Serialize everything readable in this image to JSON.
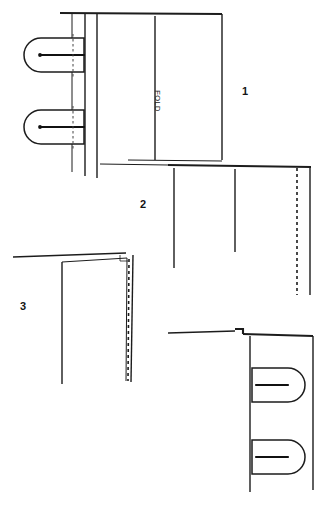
{
  "document": {
    "title": "Garment Construction Diagram",
    "kind": "line-drawing technical illustration",
    "background_color": "#ffffff",
    "ink_color": "#1c1c1c",
    "canvas": {
      "width": 323,
      "height": 506
    }
  },
  "labels": {
    "fold": "FOLD",
    "step_1": "1",
    "step_2": "2",
    "step_3": "3"
  },
  "steps": [
    {
      "number": "1",
      "label_position": {
        "x": 245,
        "y": 95
      },
      "description": "Flat panel with fold line at center and two belt-loop tabs at left edge",
      "fold_line": {
        "x": 155,
        "y_top": 16,
        "y_bottom": 160,
        "text": "FOLD"
      },
      "tabs": [
        {
          "index": 1,
          "center_y": 55,
          "tack_dot_x": 40
        },
        {
          "index": 2,
          "center_y": 127,
          "tack_dot_x": 40
        }
      ]
    },
    {
      "number": "2",
      "label_position": {
        "x": 143,
        "y": 208
      },
      "description": "Folded panel shown from edge with stitch line marked by dashes near right side",
      "stitch_line": {
        "x": 297,
        "y_top": 167,
        "y_bottom": 295,
        "style": "dashed"
      }
    },
    {
      "number": "3",
      "label_position": {
        "x": 23,
        "y": 310
      },
      "description": "Turned panel with topstitching along the right folded edge",
      "stitch_line": {
        "x": 128,
        "y_top": 258,
        "y_bottom": 382,
        "style": "dashed"
      }
    },
    {
      "number": "4",
      "label_position": null,
      "description": "Completed piece showing belt-loop tabs projecting to the right",
      "tabs": [
        {
          "index": 1,
          "center_y": 385,
          "tack_dot_x": 285
        },
        {
          "index": 2,
          "center_y": 457,
          "tack_dot_x": 285
        }
      ]
    }
  ]
}
